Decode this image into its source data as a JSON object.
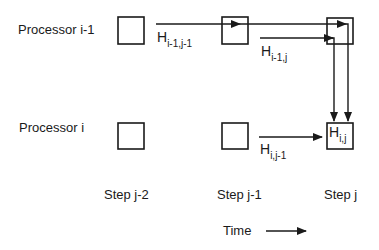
{
  "rows": {
    "top": "Processor i-1",
    "bottom": "Processor i"
  },
  "steps": [
    "Step j-2",
    "Step j-1",
    "Step j"
  ],
  "time_label": "Time",
  "edges": {
    "h_prev_prev": {
      "base": "H",
      "sub": "i-1,j-1"
    },
    "h_prev_cur": {
      "base": "H",
      "sub": "i-1,j"
    },
    "h_cur_prev": {
      "base": "H",
      "sub": "i,j-1"
    },
    "h_cur": {
      "base": "H",
      "sub": "i,j"
    }
  },
  "colors": {
    "stroke": "#1a1a1a",
    "background": "#ffffff"
  }
}
